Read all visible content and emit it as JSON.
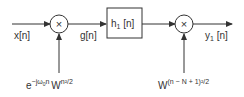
{
  "diagram": {
    "type": "block-diagram",
    "input_label": "x[n]",
    "intermediate_label": "g[n]",
    "output_label": "y1 [n]",
    "output_label_main": "y",
    "output_label_sub": "1",
    "output_label_arg": " [n]",
    "multiplier_symbol": "×",
    "filter_block": {
      "label_main": "h",
      "label_sub": "1",
      "label_arg": " [n]"
    },
    "multiplier1_input": {
      "base1": "e",
      "exp1": "−jω",
      "exp1_sub": "0",
      "exp1_tail": "n",
      "base2": "W",
      "exp2": "n²/2"
    },
    "multiplier2_input": {
      "base": "W",
      "exp": "(n − N + 1)²/2"
    },
    "colors": {
      "stroke": "#333333",
      "background": "#ffffff"
    }
  }
}
